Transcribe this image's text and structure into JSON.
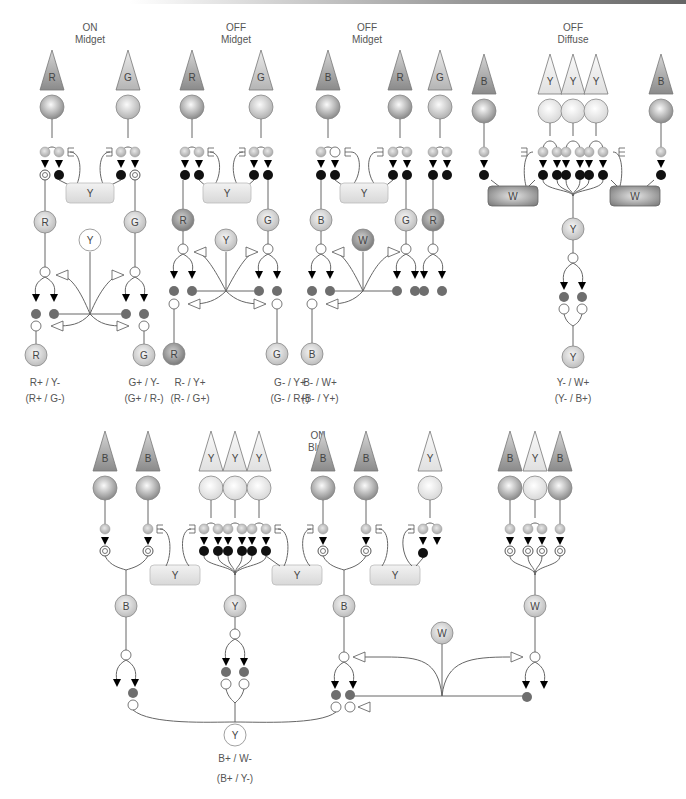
{
  "diagram": {
    "panels": [
      {
        "id": "on_midget",
        "title": [
          "ON",
          "Midget"
        ],
        "captions": [
          {
            "main": "R+ / Y-",
            "alt": "(R+ / G-)"
          },
          {
            "main": "G+ / Y-",
            "alt": "(G+ / R-)"
          }
        ]
      },
      {
        "id": "off_midget_1",
        "title": [
          "OFF",
          "Midget"
        ],
        "captions": [
          {
            "main": "R- / Y+",
            "alt": "(R- / G+)"
          },
          {
            "main": "G- / Y+",
            "alt": "(G- / R+)"
          }
        ]
      },
      {
        "id": "off_midget_2",
        "title": [
          "OFF",
          "Midget"
        ],
        "captions": [
          {
            "main": "B- / W+",
            "alt": "(B- / Y+)"
          }
        ]
      },
      {
        "id": "off_diffuse",
        "title": [
          "OFF",
          "Diffuse"
        ],
        "captions": [
          {
            "main": "Y- / W+",
            "alt": "(Y- / B+)"
          }
        ]
      },
      {
        "id": "on_blue",
        "title": [
          "ON",
          "Blue"
        ],
        "captions": [
          {
            "main": "B+ / W-",
            "alt": "(B+ / Y-)"
          }
        ]
      }
    ],
    "cell_labels": {
      "R": "R",
      "G": "G",
      "B": "B",
      "Y": "Y",
      "W": "W"
    },
    "colors": {
      "cone_R": "#9a9a9a",
      "cone_G": "#c8c8c8",
      "cone_B": "#8c8c8c",
      "cone_Y": "#ececec",
      "bipolar_dark": "#111111",
      "ganglion_dark": "#6e6e6e",
      "horizontal_light": "#e6e6e6",
      "horizontal_dark": "#8a8a8a"
    },
    "legend_icons": [
      "cone-triangle-icon",
      "cone-soma-icon",
      "ribbon-synapse-icon",
      "excitatory-arrow-icon",
      "inhibitory-open-arrow-icon"
    ]
  }
}
